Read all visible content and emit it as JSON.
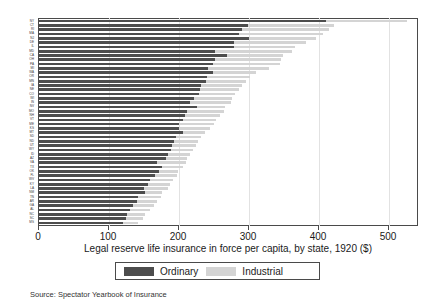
{
  "chart_data": {
    "type": "bar",
    "orientation": "horizontal",
    "stacked": true,
    "title": "",
    "xlabel": "Legal reserve life insurance in force per capita, by state, 1920 ($)",
    "ylabel": "",
    "xlim": [
      0,
      540
    ],
    "xticks": [
      0,
      100,
      200,
      300,
      400,
      500
    ],
    "xtick_labels": [
      "0",
      "100",
      "200",
      "300",
      "400",
      "500"
    ],
    "grid": true,
    "grid_axis": "x",
    "legend_position": "below-axis-centered",
    "legend": [
      "Ordinary",
      "Industrial"
    ],
    "source_note": "Source: Spectator Yearbook of Insurance",
    "colors": {
      "ordinary": "#4d4d4d",
      "industrial": "#d4d4d4",
      "grid": "#e2e2e2",
      "frame": "#4a4a4a",
      "background": "#ffffff"
    },
    "categories": [
      "NY",
      "CT",
      "RI",
      "MA",
      "NJ",
      "DE",
      "IL",
      "MD",
      "CA",
      "OH",
      "PA",
      "MI",
      "WA",
      "OR",
      "MN",
      "IA",
      "NE",
      "CO",
      "WI",
      "IN",
      "NV",
      "MO",
      "NH",
      "VT",
      "ME",
      "KS",
      "MT",
      "SD",
      "ND",
      "UT",
      "WY",
      "ID",
      "AZ",
      "VA",
      "TX",
      "OK",
      "FL",
      "WV",
      "KY",
      "LA",
      "NM",
      "TN",
      "AR",
      "GA",
      "AL",
      "NC",
      "SC",
      "MS"
    ],
    "series": [
      {
        "name": "Ordinary",
        "values": [
          410,
          298,
          290,
          285,
          300,
          278,
          278,
          252,
          268,
          252,
          248,
          242,
          248,
          240,
          238,
          232,
          230,
          228,
          222,
          216,
          225,
          212,
          208,
          205,
          200,
          200,
          205,
          196,
          193,
          190,
          188,
          184,
          182,
          168,
          175,
          172,
          165,
          158,
          155,
          150,
          152,
          142,
          140,
          134,
          130,
          126,
          124,
          120
        ]
      },
      {
        "name": "Industrial",
        "values": [
          115,
          124,
          124,
          120,
          96,
          104,
          88,
          110,
          80,
          94,
          96,
          86,
          62,
          62,
          58,
          58,
          56,
          52,
          54,
          58,
          40,
          52,
          50,
          48,
          50,
          44,
          32,
          36,
          34,
          34,
          32,
          32,
          30,
          42,
          30,
          26,
          32,
          34,
          32,
          34,
          24,
          32,
          28,
          30,
          28,
          26,
          24,
          22
        ]
      }
    ],
    "totals": [
      525,
      422,
      414,
      405,
      396,
      382,
      366,
      362,
      348,
      346,
      344,
      328,
      310,
      302,
      296,
      290,
      286,
      280,
      276,
      274,
      265,
      264,
      258,
      253,
      250,
      244,
      237,
      232,
      227,
      224,
      220,
      216,
      212,
      210,
      205,
      198,
      197,
      192,
      187,
      184,
      176,
      174,
      168,
      164,
      158,
      152,
      148,
      142
    ]
  }
}
